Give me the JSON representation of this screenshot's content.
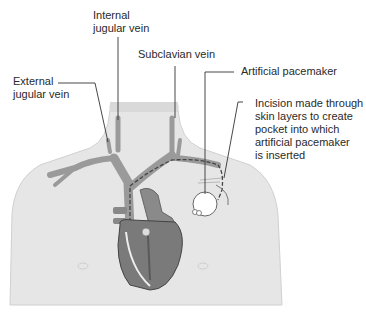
{
  "diagram": {
    "labels": {
      "internal_jugular": "Internal\njugular vein",
      "external_jugular": "External\njugular vein",
      "subclavian": "Subclavian vein",
      "pacemaker": "Artificial pacemaker",
      "incision": "Incision made through\nskin layers to create\npocket into which\nartificial pacemaker\nis inserted"
    },
    "colors": {
      "skin": "#e6e6e6",
      "vein": "#9a9a9a",
      "heart": "#7a7a7a",
      "heart_dark": "#555555",
      "leader": "#333333",
      "device": "#ffffff"
    }
  }
}
